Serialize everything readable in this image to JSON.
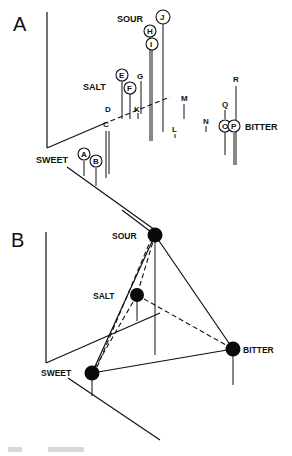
{
  "panels": {
    "A": {
      "label": "A",
      "axis_labels": {
        "sour": "SOUR",
        "salt": "SALT",
        "sweet": "SWEET",
        "bitter": "BITTER"
      },
      "points": [
        {
          "id": "A",
          "circled": true
        },
        {
          "id": "B",
          "circled": true
        },
        {
          "id": "C",
          "circled": false
        },
        {
          "id": "D",
          "circled": false
        },
        {
          "id": "E",
          "circled": true
        },
        {
          "id": "F",
          "circled": true
        },
        {
          "id": "G",
          "circled": false
        },
        {
          "id": "H",
          "circled": true
        },
        {
          "id": "I",
          "circled": true
        },
        {
          "id": "J",
          "circled": true
        },
        {
          "id": "K",
          "circled": false
        },
        {
          "id": "L",
          "circled": false
        },
        {
          "id": "M",
          "circled": false
        },
        {
          "id": "N",
          "circled": false
        },
        {
          "id": "O",
          "circled": true
        },
        {
          "id": "P",
          "circled": true
        },
        {
          "id": "Q",
          "circled": false
        },
        {
          "id": "R",
          "circled": false
        }
      ]
    },
    "B": {
      "label": "B",
      "vertices": {
        "sour": "SOUR",
        "salt": "SALT",
        "sweet": "SWEET",
        "bitter": "BITTER"
      }
    }
  }
}
